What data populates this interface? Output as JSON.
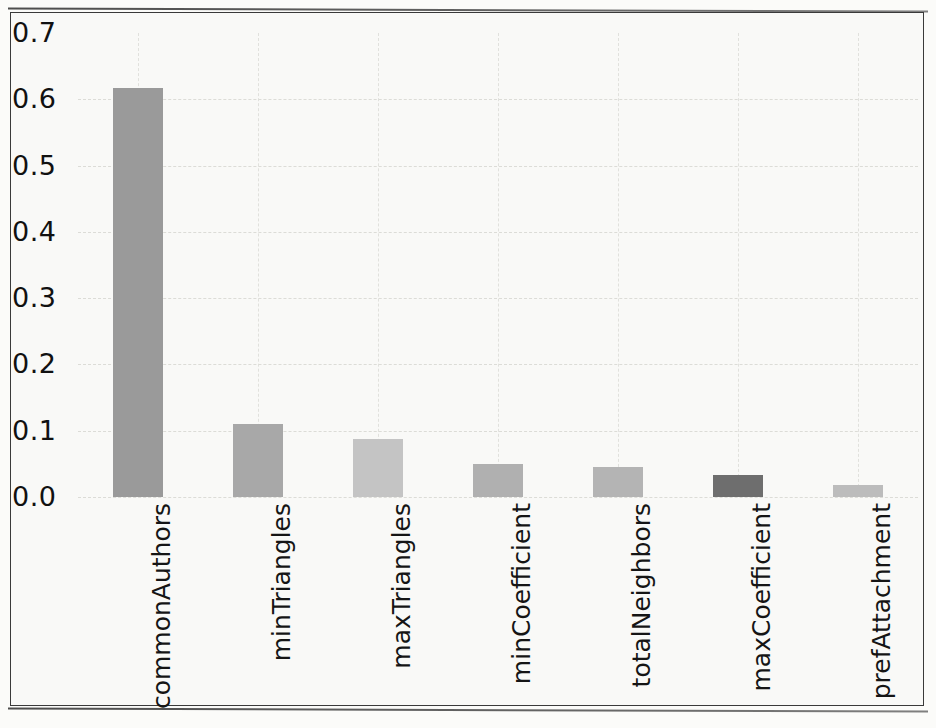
{
  "figure": {
    "background_color": "#f9f9f7",
    "frame_color": "#3a3a3a"
  },
  "chart_data": {
    "type": "bar",
    "title": "",
    "subtitle": "",
    "xlabel": "",
    "ylabel": "",
    "categories": [
      "commonAuthors",
      "minTriangles",
      "maxTriangles",
      "minCoefficient",
      "totalNeighbors",
      "maxCoefficient",
      "prefAttachment"
    ],
    "values": [
      0.617,
      0.11,
      0.088,
      0.05,
      0.045,
      0.033,
      0.018
    ],
    "bar_colors": [
      "#9a9a9a",
      "#a8a8a8",
      "#c4c4c4",
      "#b0b0b0",
      "#b4b4b4",
      "#6e6e6e",
      "#bcbcbc"
    ],
    "ylim": [
      0.0,
      0.7
    ],
    "ytick_values": [
      0.0,
      0.1,
      0.2,
      0.3,
      0.4,
      0.5,
      0.6,
      0.7
    ],
    "ytick_labels": [
      "0.0",
      "0.1",
      "0.2",
      "0.3",
      "0.4",
      "0.5",
      "0.6",
      "0.7"
    ],
    "grid": true,
    "grid_style": "dashed",
    "grid_color": "#d7d7d2",
    "legend": false,
    "legend_position": "none",
    "xtick_rotation": 90,
    "annotations": []
  }
}
